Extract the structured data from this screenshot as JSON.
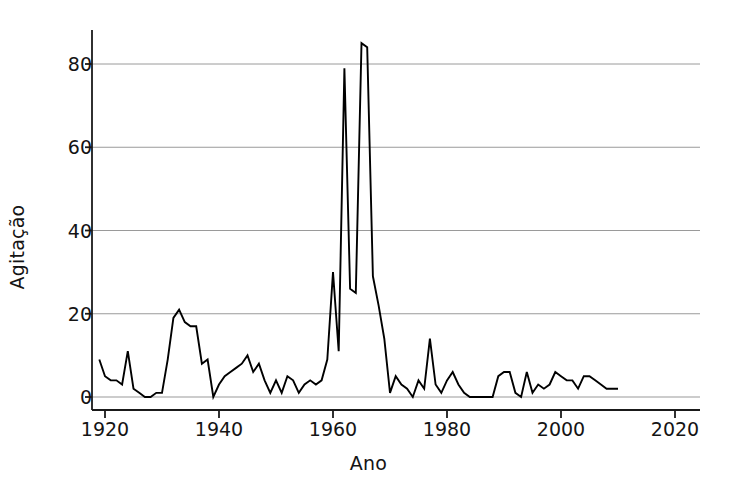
{
  "chart_data": {
    "type": "line",
    "title": "",
    "subtitle": "",
    "xlabel": "Ano",
    "ylabel": "Agitação",
    "xlim": [
      1918,
      2022
    ],
    "ylim": [
      0,
      88
    ],
    "xticks": [
      1920,
      1940,
      1960,
      1980,
      2000,
      2020
    ],
    "yticks": [
      0,
      20,
      40,
      60,
      80
    ],
    "grid": "horizontal",
    "legend": null,
    "series": [
      {
        "name": "Agitação",
        "color": "#000000",
        "x": [
          1919,
          1920,
          1921,
          1922,
          1923,
          1924,
          1925,
          1926,
          1927,
          1928,
          1929,
          1930,
          1931,
          1932,
          1933,
          1934,
          1935,
          1936,
          1937,
          1938,
          1939,
          1940,
          1941,
          1942,
          1943,
          1944,
          1945,
          1946,
          1947,
          1948,
          1949,
          1950,
          1951,
          1952,
          1953,
          1954,
          1955,
          1956,
          1957,
          1958,
          1959,
          1960,
          1961,
          1962,
          1963,
          1964,
          1965,
          1966,
          1967,
          1968,
          1969,
          1970,
          1971,
          1972,
          1973,
          1974,
          1975,
          1976,
          1977,
          1978,
          1979,
          1980,
          1981,
          1982,
          1983,
          1984,
          1985,
          1986,
          1987,
          1988,
          1989,
          1990,
          1991,
          1992,
          1993,
          1994,
          1995,
          1996,
          1997,
          1998,
          1999,
          2000,
          2001,
          2002,
          2003,
          2004,
          2005,
          2006,
          2007,
          2008,
          2009,
          2010
        ],
        "y": [
          9,
          5,
          4,
          4,
          3,
          11,
          2,
          1,
          0,
          0,
          1,
          1,
          9,
          19,
          21,
          18,
          17,
          17,
          8,
          9,
          0,
          3,
          5,
          6,
          7,
          8,
          10,
          6,
          8,
          4,
          1,
          4,
          1,
          5,
          4,
          1,
          3,
          4,
          3,
          4,
          9,
          30,
          11,
          79,
          26,
          25,
          85,
          84,
          29,
          22,
          14,
          1,
          5,
          3,
          2,
          0,
          4,
          2,
          14,
          3,
          1,
          4,
          6,
          3,
          1,
          0,
          0,
          0,
          0,
          0,
          5,
          6,
          6,
          1,
          0,
          6,
          1,
          3,
          2,
          3,
          6,
          5,
          4,
          4,
          2,
          5,
          5,
          4,
          3,
          2,
          2,
          2
        ]
      }
    ]
  },
  "axes": {
    "ylabel": "Agitação",
    "xlabel": "Ano",
    "yticklabels": [
      "0",
      "20",
      "40",
      "60",
      "80"
    ],
    "xticklabels": [
      "1920",
      "1940",
      "1960",
      "1980",
      "2000",
      "2020"
    ]
  },
  "style": {
    "line_color": "#000000",
    "grid_color": "#9a9a9a",
    "axis_color": "#1a1a1a",
    "background": "#ffffff"
  }
}
